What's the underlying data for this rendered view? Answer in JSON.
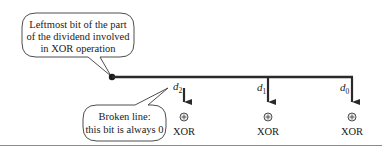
{
  "diagram": {
    "top_callout": {
      "lines": [
        "Leftmost bit of the part",
        "of the dividend involved",
        "in XOR operation"
      ]
    },
    "bottom_callout": {
      "lines": [
        "Broken line:",
        "this bit is always 0"
      ]
    },
    "branches": [
      {
        "label": "d",
        "subscript": "2",
        "xor_label": "XOR",
        "line_style": "broken"
      },
      {
        "label": "d",
        "subscript": "1",
        "xor_label": "XOR",
        "line_style": "solid"
      },
      {
        "label": "d",
        "subscript": "0",
        "xor_label": "XOR",
        "line_style": "solid"
      }
    ],
    "xor_symbol": "⊕",
    "colors": {
      "line": "#2a2a2a",
      "text": "#1a1a1a",
      "rule": "#8a8a8a",
      "background": "#ffffff"
    }
  }
}
